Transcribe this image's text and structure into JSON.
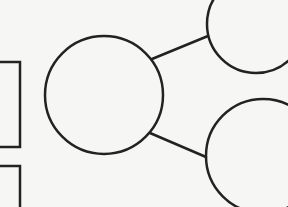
{
  "diagram": {
    "type": "tree-graphic-organizer",
    "background": "#f6f6f4",
    "stroke_color": "#222222",
    "stroke_width": 2.5,
    "boxes": [
      {
        "id": "box-top",
        "x": -10,
        "y": 62,
        "width": 30,
        "height": 85,
        "label": ""
      },
      {
        "id": "box-bottom",
        "x": -10,
        "y": 166,
        "width": 30,
        "height": 60,
        "label": ""
      }
    ],
    "circles": [
      {
        "id": "center-circle",
        "cx": 104,
        "cy": 95,
        "r": 59,
        "label": ""
      },
      {
        "id": "top-right-circle",
        "cx": 256,
        "cy": 24,
        "r": 49,
        "label": ""
      },
      {
        "id": "bottom-right-circle",
        "cx": 263,
        "cy": 156,
        "r": 57,
        "label": ""
      }
    ],
    "connectors": [
      {
        "id": "connector-top",
        "from": "center-circle",
        "to": "top-right-circle",
        "x1": 152,
        "y1": 59,
        "x2": 208,
        "y2": 36
      },
      {
        "id": "connector-bottom",
        "from": "center-circle",
        "to": "bottom-right-circle",
        "x1": 150,
        "y1": 133,
        "x2": 206,
        "y2": 157
      }
    ]
  }
}
